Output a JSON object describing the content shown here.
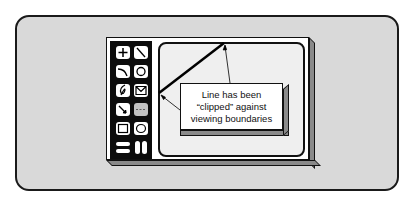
{
  "diagram": {
    "type": "illustration",
    "callout": {
      "lines": [
        "Line has been",
        "“clipped” against",
        "viewing boundaries"
      ]
    },
    "toolbar": {
      "tools": [
        {
          "name": "crosshair-icon"
        },
        {
          "name": "line-icon"
        },
        {
          "name": "arc-icon"
        },
        {
          "name": "circle-icon"
        },
        {
          "name": "freehand-icon"
        },
        {
          "name": "envelope-icon"
        },
        {
          "name": "arrow-icon"
        },
        {
          "name": "dashed-line-icon"
        },
        {
          "name": "rectangle-icon"
        },
        {
          "name": "ellipse-icon"
        },
        {
          "name": "horizontal-bars-icon"
        },
        {
          "name": "vertical-bars-icon"
        }
      ]
    },
    "colors": {
      "panel": "#d9d9d9",
      "outline": "#111111",
      "toolbar": "#0c0c0c",
      "screen": "#efefef",
      "depth": "#8a8a8a"
    }
  }
}
